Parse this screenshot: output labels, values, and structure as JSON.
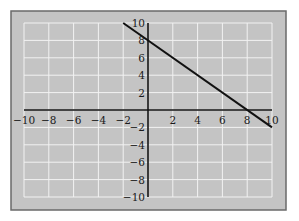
{
  "chart_data": {
    "type": "line",
    "title": "",
    "xlabel": "",
    "ylabel": "",
    "xlim": [
      -10,
      10
    ],
    "ylim": [
      -10,
      10
    ],
    "grid": true,
    "grid_step": 2,
    "x_ticks": [
      "-10",
      "-8",
      "-6",
      "-4",
      "-2",
      "2",
      "4",
      "6",
      "8",
      "10"
    ],
    "y_ticks": [
      "10",
      "8",
      "6",
      "4",
      "2",
      "-2",
      "-4",
      "-6",
      "-8",
      "-10"
    ],
    "x_tick_values": [
      -10,
      -8,
      -6,
      -4,
      -2,
      2,
      4,
      6,
      8,
      10
    ],
    "y_tick_values": [
      10,
      8,
      6,
      4,
      2,
      -2,
      -4,
      -6,
      -8,
      -10
    ],
    "series": [
      {
        "name": "y = -x + 8",
        "x": [
          -2,
          10
        ],
        "y": [
          10,
          -2
        ],
        "color": "#111111"
      }
    ],
    "legend": null,
    "colors": {
      "panel": "#c4c4c4",
      "panel_border": "#6a6a6a",
      "grid": "#f2f2f2",
      "axis": "#111111"
    }
  }
}
